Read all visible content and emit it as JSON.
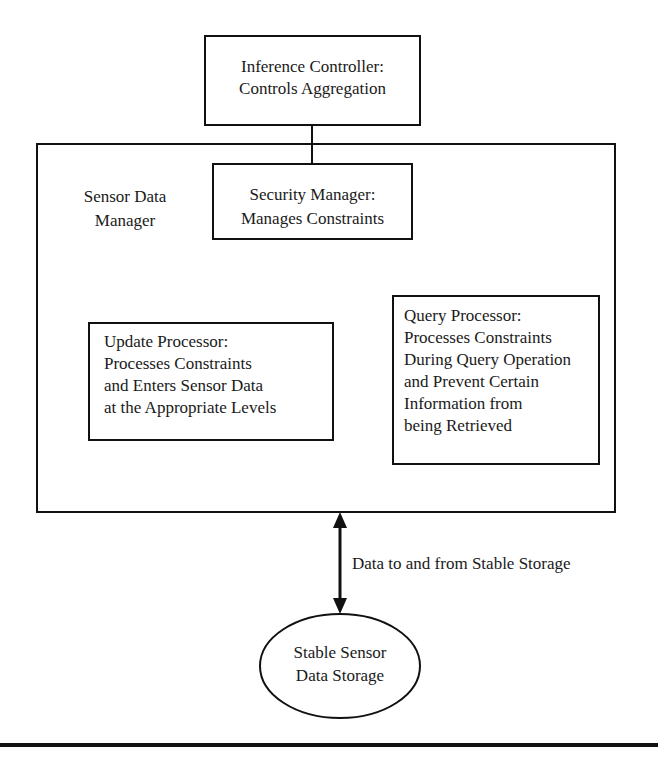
{
  "diagram": {
    "inference_controller": {
      "line1": "Inference Controller:",
      "line2": "Controls Aggregation"
    },
    "sensor_data_manager": {
      "line1": "Sensor Data",
      "line2": "Manager"
    },
    "security_manager": {
      "line1": "Security Manager:",
      "line2": "Manages Constraints"
    },
    "update_processor": {
      "lines": [
        "Update Processor:",
        "Processes Constraints",
        "and Enters Sensor Data",
        "at the Appropriate Levels"
      ]
    },
    "query_processor": {
      "lines": [
        "Query Processor:",
        "Processes Constraints",
        "During Query Operation",
        "and Prevent Certain",
        "Information from",
        "being Retrieved"
      ]
    },
    "arrow_label": "Data to and from Stable Storage",
    "stable_storage": {
      "line1": "Stable Sensor",
      "line2": "Data Storage"
    },
    "colors": {
      "line": "#111111",
      "background": "#ffffff",
      "text": "#1a1a1a"
    }
  }
}
